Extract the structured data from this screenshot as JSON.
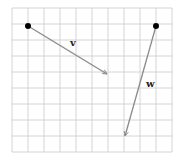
{
  "diagram": {
    "grid": {
      "x0": 12,
      "y0": 8,
      "cols": 10,
      "rows": 9,
      "cell": 16,
      "color": "#d4d4d4"
    },
    "vectors": [
      {
        "name": "v",
        "label": "v",
        "tail": [
          28,
          26
        ],
        "head": [
          107,
          74
        ],
        "label_pos": [
          70,
          46
        ]
      },
      {
        "name": "w",
        "label": "w",
        "tail": [
          156,
          26
        ],
        "head": [
          125,
          136
        ],
        "label_pos": [
          146,
          87
        ]
      }
    ],
    "colors": {
      "vector": "#8a8a8a",
      "dot": "#000000"
    }
  }
}
